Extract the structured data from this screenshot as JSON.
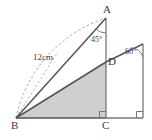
{
  "figure": {
    "kind": "geometry-diagram",
    "colors": {
      "stroke": "#4a4a4a",
      "light_stroke": "#9a9a9a",
      "shade_fill": "#cfcfcf",
      "label": "#3a3a3a",
      "background": "#ffffff"
    }
  },
  "vertices": [
    {
      "name": "A",
      "label": "A",
      "x": 106,
      "y": 18
    },
    {
      "name": "B",
      "label": "B",
      "x": 16,
      "y": 118
    },
    {
      "name": "C",
      "label": "C",
      "x": 106,
      "y": 118
    },
    {
      "name": "D",
      "label": "D",
      "x": 106,
      "y": 62
    },
    {
      "name": "E",
      "label": "",
      "x": 143,
      "y": 44
    },
    {
      "name": "F",
      "label": "",
      "x": 143,
      "y": 118
    }
  ],
  "annotations": {
    "angle_at_A": "45°",
    "angle_at_E": "60°",
    "length_BA": "12cm"
  },
  "right_angles": [
    {
      "at": "C",
      "symbol": "square"
    },
    {
      "at": "F",
      "symbol": "square"
    }
  ],
  "arc": {
    "name": "radius-arc-from-B",
    "style": "dashed",
    "radius_label": "12cm"
  },
  "shaded_region": {
    "name": "triangle-BDC",
    "vertices": [
      "B",
      "D",
      "C"
    ]
  }
}
